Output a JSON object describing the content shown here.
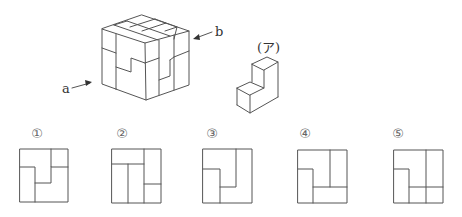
{
  "figure": {
    "cube": {
      "label_a": "a",
      "label_b": "b"
    },
    "piece": {
      "label": "(ア)"
    },
    "options": [
      {
        "label": "①"
      },
      {
        "label": "②"
      },
      {
        "label": "③"
      },
      {
        "label": "④"
      },
      {
        "label": "⑤"
      }
    ],
    "colors": {
      "line": "#555555",
      "background": "#ffffff"
    }
  }
}
